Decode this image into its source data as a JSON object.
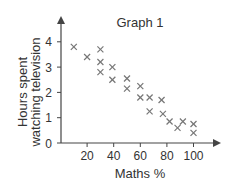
{
  "chart_data": {
    "type": "scatter",
    "title": "Graph 1",
    "xlabel": "Maths %",
    "ylabel": [
      "Hours spent",
      "watching television"
    ],
    "xlim": [
      0,
      115
    ],
    "ylim": [
      0,
      4.8
    ],
    "xticks": [
      20,
      40,
      60,
      80,
      100
    ],
    "yticks": [
      0,
      1,
      2,
      3,
      4
    ],
    "grid": false,
    "legend": null,
    "marker": "x",
    "series": [
      {
        "name": "students",
        "points": [
          {
            "x": 10,
            "y": 3.8
          },
          {
            "x": 20,
            "y": 3.4
          },
          {
            "x": 30,
            "y": 3.7
          },
          {
            "x": 30,
            "y": 3.2
          },
          {
            "x": 30,
            "y": 2.8
          },
          {
            "x": 39,
            "y": 3.0
          },
          {
            "x": 39,
            "y": 2.5
          },
          {
            "x": 50,
            "y": 2.55
          },
          {
            "x": 50,
            "y": 2.15
          },
          {
            "x": 60,
            "y": 2.25
          },
          {
            "x": 60,
            "y": 1.8
          },
          {
            "x": 67,
            "y": 1.8
          },
          {
            "x": 67,
            "y": 1.25
          },
          {
            "x": 76,
            "y": 1.7
          },
          {
            "x": 77,
            "y": 1.15
          },
          {
            "x": 82,
            "y": 0.85
          },
          {
            "x": 88,
            "y": 0.6
          },
          {
            "x": 92,
            "y": 0.85
          },
          {
            "x": 100,
            "y": 0.75
          },
          {
            "x": 100,
            "y": 0.4
          }
        ]
      }
    ]
  },
  "colors": {
    "axis": "#444444",
    "marker": "#777777",
    "text": "#333333"
  }
}
